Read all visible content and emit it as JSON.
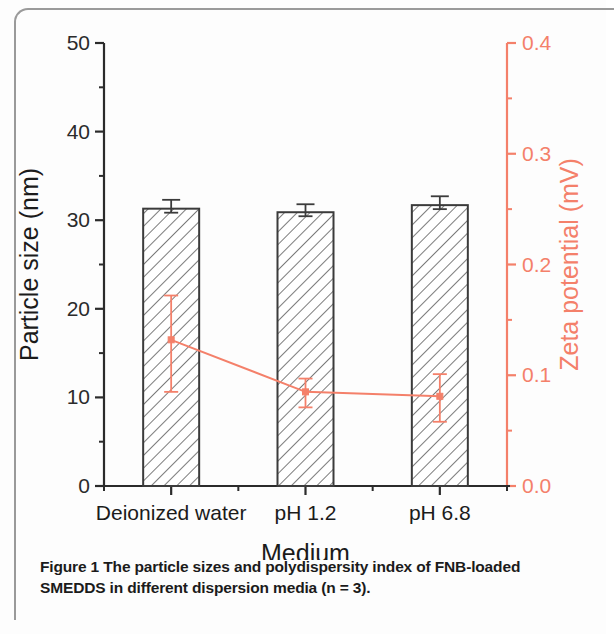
{
  "figure": {
    "caption_label": "Figure 1",
    "caption_line1": "The particle sizes and polydispersity index of FNB-loaded",
    "caption_line2": "SMEDDS in different dispersion media (n = 3)."
  },
  "colors": {
    "bar_stroke": "#3b3b3b",
    "bar_hatch": "#5a5a5a",
    "bar_fill": "#ffffff",
    "left_axis": "#2b2b2b",
    "right_axis": "#f4806a",
    "zeta_line": "#f4806a",
    "text": "#1b1b1b"
  },
  "chart_data": {
    "type": "bar",
    "title": "",
    "subtitle": "",
    "xlabel": "Medium",
    "categories": [
      "Deionized water",
      "pH 1.2",
      "pH 6.8"
    ],
    "grid": false,
    "legend": null,
    "series": [
      {
        "name": "Particle size",
        "type": "bar",
        "axis": "left",
        "unit": "nm",
        "values": [
          31.3,
          30.9,
          31.7
        ],
        "errors": [
          1.0,
          0.9,
          1.0
        ],
        "color": "#ffffff",
        "hatch": "///"
      },
      {
        "name": "Zeta potential",
        "type": "line",
        "axis": "right",
        "unit": "mV",
        "values": [
          0.132,
          0.085,
          0.081
        ],
        "error_low": [
          0.047,
          0.014,
          0.023
        ],
        "error_high": [
          0.04,
          0.012,
          0.02
        ],
        "color": "#f4806a"
      }
    ],
    "axes": {
      "left": {
        "label": "Particle size (nm)",
        "ylim": [
          0,
          50
        ],
        "ticks": [
          0,
          10,
          20,
          30,
          40,
          50
        ],
        "tick_labels": [
          "0",
          "10",
          "20",
          "30",
          "40",
          "50"
        ],
        "minor_ticks": [
          5,
          15,
          25,
          35,
          45
        ],
        "color": "#2b2b2b"
      },
      "right": {
        "label": "Zeta potential (mV)",
        "ylim": [
          0.0,
          0.4
        ],
        "ticks": [
          0.0,
          0.1,
          0.2,
          0.3,
          0.4
        ],
        "tick_labels": [
          "0.0",
          "0.1",
          "0.2",
          "0.3",
          "0.4"
        ],
        "minor_ticks": [
          0.05,
          0.15,
          0.25,
          0.35
        ],
        "color": "#f4806a"
      },
      "bottom": {
        "label": "Medium",
        "tick_labels": [
          "Deionized water",
          "pH 1.2",
          "pH 6.8"
        ],
        "color": "#2b2b2b"
      }
    }
  }
}
